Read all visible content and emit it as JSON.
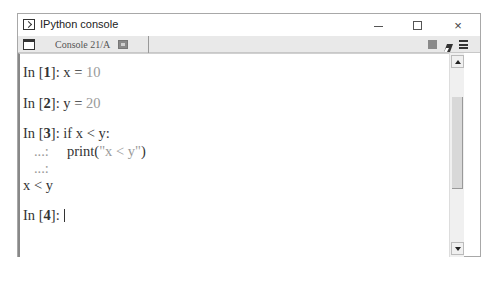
{
  "window": {
    "title": "IPython console",
    "controls": {
      "minimize": "minimize",
      "maximize": "maximize",
      "close": "×"
    }
  },
  "tabbar": {
    "tabs": [
      {
        "label": "Console 21/A",
        "active": true
      }
    ],
    "icons": [
      "options-icon",
      "stop-icon",
      "clear-console-icon",
      "menu-icon"
    ],
    "stop_color": "#8a8a8a"
  },
  "console": {
    "lines": [
      {
        "type": "input",
        "prompt_in": "In [",
        "num": "1",
        "prompt_end": "]: ",
        "code": "x = ",
        "value": "10"
      },
      {
        "type": "input",
        "prompt_in": "In [",
        "num": "2",
        "prompt_end": "]: ",
        "code": "y = ",
        "value": "20"
      },
      {
        "type": "input",
        "prompt_in": "In [",
        "num": "3",
        "prompt_end": "]: ",
        "code": "if x < y:"
      },
      {
        "type": "continuation",
        "prompt": "   ...:",
        "code": "     print(",
        "string": "\"x < y\"",
        "close": ")"
      },
      {
        "type": "continuation",
        "prompt": "   ...:"
      },
      {
        "type": "output",
        "text": "x < y"
      },
      {
        "type": "input",
        "prompt_in": "In [",
        "num": "4",
        "prompt_end": "]: ",
        "code": ""
      }
    ],
    "colors": {
      "text": "#333333",
      "literal": "#9a9a9a"
    }
  },
  "scrollbar": {
    "thumb_top": 44,
    "thumb_height": 92
  }
}
